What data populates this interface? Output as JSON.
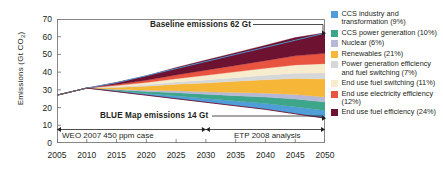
{
  "chart_data": {
    "type": "area",
    "title": "",
    "xlabel": "",
    "ylabel": "Emissions (Gt CO2)",
    "ylabel_main": "Emissions (Gt CO",
    "ylabel_sub": "2",
    "ylabel_tail": ")",
    "xlim": [
      2005,
      2050
    ],
    "ylim": [
      0,
      70
    ],
    "grid": false,
    "legend_position": "right",
    "x": [
      2005,
      2010,
      2015,
      2020,
      2025,
      2030,
      2035,
      2040,
      2045,
      2050
    ],
    "ytick_labels": [
      "70",
      "60",
      "50",
      "40",
      "30",
      "20",
      "10",
      "0"
    ],
    "ytick_values": [
      70,
      60,
      50,
      40,
      30,
      20,
      10,
      0
    ],
    "xtick_labels": [
      "2005",
      "2010",
      "2015",
      "2020",
      "2025",
      "2030",
      "2035",
      "2040",
      "2045",
      "2050"
    ],
    "baseline_label": "Baseline emissions 62 Gt",
    "baseline_value": 62,
    "bluemap_label": "BLUE Map emissions 14 Gt",
    "bluemap_value": 14,
    "baseline_series": {
      "name": "Baseline emissions",
      "values": [
        27,
        31,
        34,
        38,
        42,
        46,
        50,
        54,
        58,
        62
      ]
    },
    "bluemap_series": {
      "name": "BLUE Map emissions",
      "values": [
        27,
        31,
        29,
        27,
        25,
        23,
        21,
        19,
        16.5,
        14
      ]
    },
    "series": [
      {
        "name": "CCS industry and transformation (9%)",
        "share_pct": 9,
        "color": "#4f9ed8",
        "values": [
          0,
          0,
          0.5,
          1.0,
          1.6,
          2.1,
          2.7,
          3.3,
          4.0,
          4.3
        ]
      },
      {
        "name": "CCS power generation (10%)",
        "share_pct": 10,
        "color": "#3da58a",
        "values": [
          0,
          0,
          0.5,
          1.1,
          1.8,
          2.4,
          3.0,
          3.6,
          4.3,
          4.8
        ]
      },
      {
        "name": "Nuclear (6%)",
        "share_pct": 6,
        "color": "#b6b8d6",
        "values": [
          0,
          0,
          0.3,
          0.7,
          1.1,
          1.4,
          1.8,
          2.2,
          2.6,
          2.9
        ]
      },
      {
        "name": "Renewables (21%)",
        "share_pct": 21,
        "color": "#f6b738",
        "values": [
          0,
          0,
          1.1,
          2.3,
          3.7,
          5.0,
          6.3,
          7.6,
          9.0,
          10.1
        ]
      },
      {
        "name": "Power generation efficiency and fuel switching (7%)",
        "share_pct": 7,
        "color": "#d6d7d9",
        "values": [
          0,
          0,
          0.4,
          0.8,
          1.2,
          1.7,
          2.1,
          2.5,
          3.0,
          3.4
        ]
      },
      {
        "name": "End use fuel switching (11%)",
        "share_pct": 11,
        "color": "#f7eccd",
        "values": [
          0,
          0,
          0.6,
          1.2,
          1.9,
          2.6,
          3.3,
          4.0,
          4.7,
          5.3
        ]
      },
      {
        "name": "End use electricity efficiency (12%)",
        "share_pct": 12,
        "color": "#e8543f",
        "values": [
          0,
          0,
          0.6,
          1.3,
          2.1,
          2.9,
          3.6,
          4.3,
          5.1,
          5.8
        ]
      },
      {
        "name": "End use fuel efficiency (24%)",
        "share_pct": 24,
        "color": "#6d1230",
        "values": [
          0,
          0,
          1.3,
          2.6,
          4.2,
          5.7,
          7.2,
          8.7,
          10.3,
          11.6
        ]
      }
    ],
    "range_annotations": [
      {
        "label": "WEO 2007 450 ppm case",
        "from": 2005,
        "to": 2030
      },
      {
        "label": "ETP 2008 analysis",
        "from": 2030,
        "to": 2050
      }
    ]
  },
  "legend": {
    "items": [
      {
        "label": "CCS industry and transformation (9%)",
        "color": "#4f9ed8"
      },
      {
        "label": "CCS power generation (10%)",
        "color": "#3da58a"
      },
      {
        "label": "Nuclear (6%)",
        "color": "#b6b8d6"
      },
      {
        "label": "Renewables (21%)",
        "color": "#f6b738"
      },
      {
        "label": "Power generation efficiency and fuel switching (7%)",
        "color": "#d6d7d9"
      },
      {
        "label": "End use fuel switching (11%)",
        "color": "#f7eccd"
      },
      {
        "label": "End use electricity efficiency (12%)",
        "color": "#e8543f"
      },
      {
        "label": "End use fuel efficiency (24%)",
        "color": "#6d1230"
      }
    ]
  }
}
